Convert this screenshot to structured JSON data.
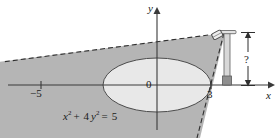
{
  "figure": {
    "kind": "math-diagram",
    "axes": {
      "x_label": "x",
      "y_label": "y",
      "origin_label": "0",
      "ticks": [
        {
          "label": "−5",
          "axis": "x"
        },
        {
          "label": "3",
          "axis": "x"
        }
      ]
    },
    "curve": {
      "equation_text": "x² + 4y² = 5",
      "equation_lhs_var1": "x",
      "equation_exp1": "2",
      "equation_op_plus": "+",
      "equation_coef": "4",
      "equation_lhs_var2": "y",
      "equation_exp2": "2",
      "equation_eq": "=",
      "equation_rhs": "5"
    },
    "annotation": {
      "height_label": "?"
    },
    "colors": {
      "shaded_region": "#b5b5b5",
      "ellipse_fill": "#e8e8e8",
      "stroke": "#3a3a3a",
      "pole": "#d0d0d0",
      "pole_base": "#8f8f8f"
    }
  }
}
